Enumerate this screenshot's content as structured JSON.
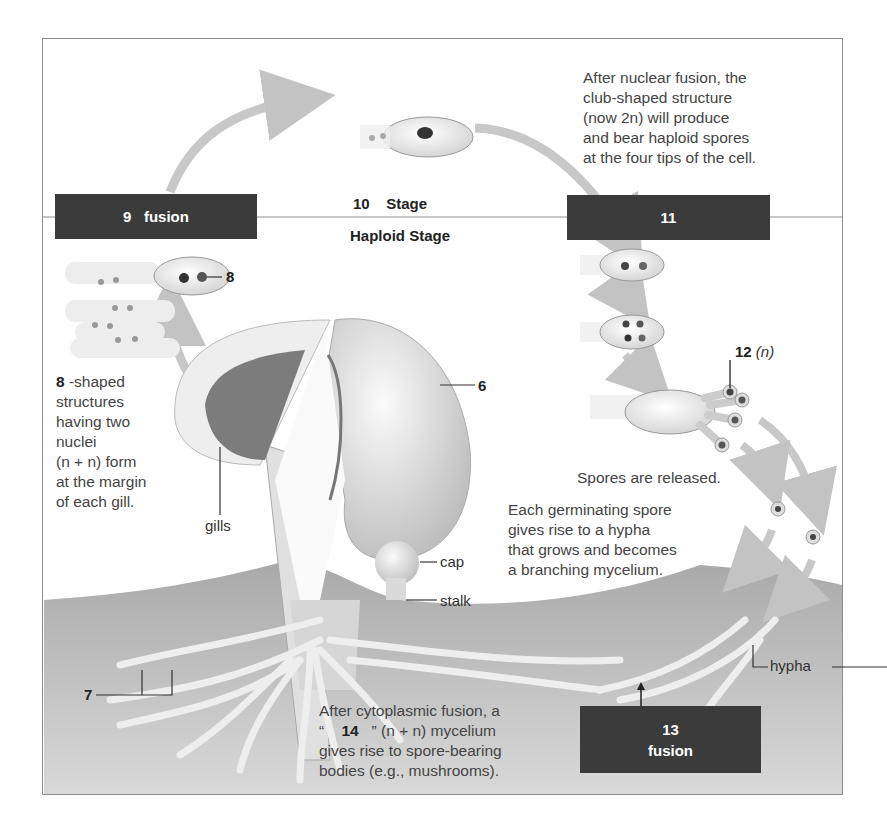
{
  "diagram": {
    "title_top": {
      "number": "10",
      "word": "Stage"
    },
    "title_bottom": "Haploid Stage",
    "boxes": {
      "box9": {
        "number": "9",
        "word": "fusion"
      },
      "box11": {
        "number": "11"
      },
      "box13": {
        "number": "13",
        "word": "fusion"
      }
    },
    "captions": {
      "nuclear_fusion": [
        "After nuclear fusion, the",
        "club-shaped structure",
        "(now 2n) will produce",
        "and bear haploid spores",
        "at the four tips of the cell."
      ],
      "club_shaped": {
        "number": "8",
        "lines": [
          "-shaped",
          "structures",
          "having two",
          "nuclei",
          "(n + n) form",
          "at the margin",
          "of each gill."
        ]
      },
      "spores_released": "Spores are released.",
      "germinating": [
        "Each germinating spore",
        "gives rise to a hypha",
        "that grows and becomes",
        "a  branching mycelium."
      ],
      "cytoplasmic": {
        "line1": "After cytoplasmic fusion, a",
        "open_quote": "“",
        "number": "14",
        "close_part": "” (n + n) mycelium",
        "line3": "gives rise to spore-bearing",
        "line4": "bodies (e.g., mushrooms)."
      }
    },
    "labels": {
      "label8": "8",
      "label6": "6",
      "label7": "7",
      "label12_num": "12",
      "label12_ploidy": "(n)",
      "gills": "gills",
      "cap": "cap",
      "stalk": "stalk",
      "hypha": "hypha"
    },
    "colors": {
      "box_fill": "#3b3b3b",
      "arrow": "#c8c8c8",
      "soil": "#b9b9b9",
      "frame": "#8c8c8c"
    }
  }
}
